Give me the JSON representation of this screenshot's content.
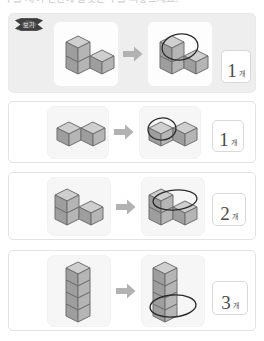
{
  "heading": "수를 세어 빈칸에 알맞은 수를 써넣으세요.",
  "example_badge": {
    "label": "보기",
    "icon": "ribbon-badge-icon"
  },
  "arrow_icon": "right-arrow-icon",
  "unit_label": "개",
  "colors": {
    "cube_top": "#cfcfcf",
    "cube_left": "#9e9e9e",
    "cube_right": "#b5b5b5",
    "cube_outline": "#6f6f6f",
    "arrow": "#b0b0b0",
    "panel_example_bg": "#eeeeee",
    "card_bg": "#f6f6f6",
    "answer_text": "#4a4a4a",
    "circle_stroke": "#2b2b2b"
  },
  "problems": [
    {
      "id": "example",
      "kind": "example",
      "shape_name": "three-cube-l-shape",
      "left_figure_alt": "쌓기나무 3개 ㄱ자 모양",
      "right_figure_alt": "맨 위 쌓기나무 1개에 동그라미 표시",
      "circled_count": 1,
      "answer": "1",
      "unit": "개"
    },
    {
      "id": "q1",
      "kind": "question",
      "shape_name": "two-cube-row",
      "left_figure_alt": "쌓기나무 2개 나란히",
      "right_figure_alt": "왼쪽 쌓기나무 1개에 동그라미 표시",
      "circled_count": 1,
      "answer": "1",
      "unit": "개"
    },
    {
      "id": "q2",
      "kind": "question",
      "shape_name": "l-shape-four-cubes",
      "left_figure_alt": "쌓기나무 ㄴ자 모양",
      "right_figure_alt": "위층 쌓기나무 2개에 동그라미 표시",
      "circled_count": 2,
      "answer": "2",
      "unit": "개"
    },
    {
      "id": "q3",
      "kind": "question",
      "shape_name": "vertical-stack-four",
      "left_figure_alt": "쌓기나무 4개 세로로 쌓음",
      "right_figure_alt": "아래쪽 쌓기나무 3개에 동그라미 표시",
      "circled_count": 3,
      "answer": "3",
      "unit": "개"
    }
  ]
}
